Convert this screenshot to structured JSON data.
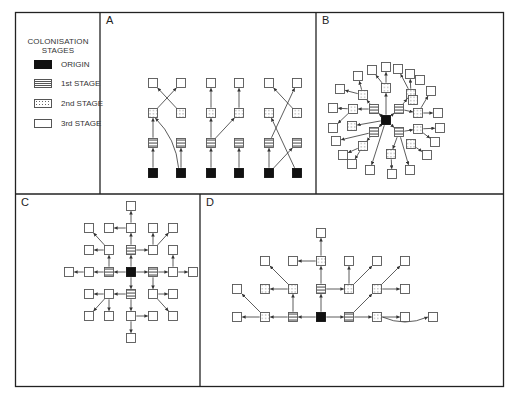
{
  "legend": {
    "title_line1": "COLONISATION",
    "title_line2": "STAGES",
    "items": [
      {
        "stage": "origin",
        "label": "ORIGIN"
      },
      {
        "stage": "first",
        "label": "1st STAGE"
      },
      {
        "stage": "second",
        "label": "2nd STAGE"
      },
      {
        "stage": "third",
        "label": "3rd STAGE"
      }
    ]
  },
  "colors": {
    "frame": "#222222",
    "node_border": "#555555",
    "origin_fill": "#111111",
    "arrow": "#333333"
  },
  "panels": {
    "A": {
      "label": "A",
      "description": "Six parallel chains of colonisation, with cross-linking between columns",
      "nodes": [
        {
          "id": "a1o",
          "stage": "origin",
          "x": 153,
          "y": 173
        },
        {
          "id": "a1f",
          "stage": "first",
          "x": 153,
          "y": 143
        },
        {
          "id": "a1s",
          "stage": "second",
          "x": 153,
          "y": 113
        },
        {
          "id": "a1t",
          "stage": "third",
          "x": 153,
          "y": 83
        },
        {
          "id": "a2o",
          "stage": "origin",
          "x": 181,
          "y": 173
        },
        {
          "id": "a2f",
          "stage": "first",
          "x": 181,
          "y": 143
        },
        {
          "id": "a2s",
          "stage": "second",
          "x": 181,
          "y": 113
        },
        {
          "id": "a2t",
          "stage": "third",
          "x": 181,
          "y": 83
        },
        {
          "id": "a3o",
          "stage": "origin",
          "x": 211,
          "y": 173
        },
        {
          "id": "a3f",
          "stage": "first",
          "x": 211,
          "y": 143
        },
        {
          "id": "a3s",
          "stage": "second",
          "x": 211,
          "y": 113
        },
        {
          "id": "a3t",
          "stage": "third",
          "x": 211,
          "y": 83
        },
        {
          "id": "a4o",
          "stage": "origin",
          "x": 239,
          "y": 173
        },
        {
          "id": "a4f",
          "stage": "first",
          "x": 239,
          "y": 143
        },
        {
          "id": "a4s",
          "stage": "second",
          "x": 239,
          "y": 113
        },
        {
          "id": "a4t",
          "stage": "third",
          "x": 239,
          "y": 83
        },
        {
          "id": "a5o",
          "stage": "origin",
          "x": 269,
          "y": 173
        },
        {
          "id": "a5f",
          "stage": "first",
          "x": 269,
          "y": 143
        },
        {
          "id": "a5s",
          "stage": "second",
          "x": 269,
          "y": 113
        },
        {
          "id": "a5t",
          "stage": "third",
          "x": 269,
          "y": 83
        },
        {
          "id": "a6o",
          "stage": "origin",
          "x": 297,
          "y": 173
        },
        {
          "id": "a6f",
          "stage": "first",
          "x": 297,
          "y": 143
        },
        {
          "id": "a6s",
          "stage": "second",
          "x": 297,
          "y": 113
        },
        {
          "id": "a6t",
          "stage": "third",
          "x": 297,
          "y": 83
        }
      ],
      "edges": [
        [
          "a1o",
          "a1f"
        ],
        [
          "a1f",
          "a1s"
        ],
        [
          "a1s",
          "a2t"
        ],
        [
          "a2o",
          "a2f"
        ],
        [
          "a2o",
          "a1s",
          "curve"
        ],
        [
          "a2s",
          "a1t"
        ],
        [
          "a3o",
          "a3f"
        ],
        [
          "a3f",
          "a3s"
        ],
        [
          "a3f",
          "a4s"
        ],
        [
          "a3s",
          "a3t"
        ],
        [
          "a4o",
          "a4f"
        ],
        [
          "a4s",
          "a4t"
        ],
        [
          "a5o",
          "a5f"
        ],
        [
          "a5o",
          "a6f"
        ],
        [
          "a5f",
          "a6t"
        ],
        [
          "a6o",
          "a5s"
        ],
        [
          "a6s",
          "a5t"
        ]
      ]
    },
    "B": {
      "label": "B",
      "description": "Radial colonisation outward from a central origin",
      "nodes": [
        {
          "id": "bo",
          "stage": "origin",
          "x": 386,
          "y": 120
        },
        {
          "id": "bf1",
          "stage": "first",
          "x": 374,
          "y": 109
        },
        {
          "id": "bf2",
          "stage": "first",
          "x": 399,
          "y": 109
        },
        {
          "id": "bf3",
          "stage": "first",
          "x": 374,
          "y": 132
        },
        {
          "id": "bf4",
          "stage": "first",
          "x": 399,
          "y": 132
        },
        {
          "id": "bs1",
          "stage": "second",
          "x": 386,
          "y": 88
        },
        {
          "id": "bs2",
          "stage": "second",
          "x": 363,
          "y": 95
        },
        {
          "id": "bs3",
          "stage": "second",
          "x": 353,
          "y": 109
        },
        {
          "id": "bs4",
          "stage": "second",
          "x": 352,
          "y": 126
        },
        {
          "id": "bs5",
          "stage": "second",
          "x": 363,
          "y": 146
        },
        {
          "id": "bs6",
          "stage": "second",
          "x": 391,
          "y": 154
        },
        {
          "id": "bs7",
          "stage": "second",
          "x": 411,
          "y": 94
        },
        {
          "id": "bs8",
          "stage": "second",
          "x": 413,
          "y": 100
        },
        {
          "id": "bs9",
          "stage": "second",
          "x": 418,
          "y": 113
        },
        {
          "id": "bs10",
          "stage": "second",
          "x": 418,
          "y": 129
        },
        {
          "id": "bs11",
          "stage": "second",
          "x": 411,
          "y": 144
        },
        {
          "id": "bt1",
          "stage": "third",
          "x": 372,
          "y": 70
        },
        {
          "id": "bt2",
          "stage": "third",
          "x": 386,
          "y": 67
        },
        {
          "id": "bt3",
          "stage": "third",
          "x": 398,
          "y": 69
        },
        {
          "id": "bt4",
          "stage": "third",
          "x": 410,
          "y": 74
        },
        {
          "id": "bt5",
          "stage": "third",
          "x": 420,
          "y": 80
        },
        {
          "id": "bt6",
          "stage": "third",
          "x": 358,
          "y": 76
        },
        {
          "id": "bt7",
          "stage": "third",
          "x": 340,
          "y": 89
        },
        {
          "id": "bt8",
          "stage": "third",
          "x": 333,
          "y": 108
        },
        {
          "id": "bt9",
          "stage": "third",
          "x": 333,
          "y": 128
        },
        {
          "id": "bt10",
          "stage": "third",
          "x": 336,
          "y": 141
        },
        {
          "id": "bt11",
          "stage": "third",
          "x": 343,
          "y": 155
        },
        {
          "id": "bt12",
          "stage": "third",
          "x": 352,
          "y": 164
        },
        {
          "id": "bt13",
          "stage": "third",
          "x": 370,
          "y": 170
        },
        {
          "id": "bt14",
          "stage": "third",
          "x": 392,
          "y": 174
        },
        {
          "id": "bt15",
          "stage": "third",
          "x": 410,
          "y": 170
        },
        {
          "id": "bt16",
          "stage": "third",
          "x": 427,
          "y": 155
        },
        {
          "id": "bt17",
          "stage": "third",
          "x": 435,
          "y": 142
        },
        {
          "id": "bt18",
          "stage": "third",
          "x": 440,
          "y": 128
        },
        {
          "id": "bt19",
          "stage": "third",
          "x": 438,
          "y": 113
        },
        {
          "id": "bt20",
          "stage": "third",
          "x": 431,
          "y": 91
        }
      ],
      "edges": [
        [
          "bo",
          "bf1"
        ],
        [
          "bo",
          "bf2"
        ],
        [
          "bo",
          "bf3"
        ],
        [
          "bo",
          "bf4"
        ],
        [
          "bo",
          "bs1"
        ],
        [
          "bo",
          "bs4"
        ],
        [
          "bo",
          "bt13"
        ],
        [
          "bf1",
          "bs2"
        ],
        [
          "bf1",
          "bs3"
        ],
        [
          "bf2",
          "bs7"
        ],
        [
          "bf2",
          "bs9"
        ],
        [
          "bf3",
          "bs5"
        ],
        [
          "bf3",
          "bt10"
        ],
        [
          "bf4",
          "bs6"
        ],
        [
          "bf4",
          "bt15"
        ],
        [
          "bf4",
          "bs10"
        ],
        [
          "bs1",
          "bt1"
        ],
        [
          "bs1",
          "bt2"
        ],
        [
          "bs2",
          "bt6"
        ],
        [
          "bs2",
          "bt7"
        ],
        [
          "bs3",
          "bt8"
        ],
        [
          "bs3",
          "bt9"
        ],
        [
          "bs5",
          "bt11"
        ],
        [
          "bs5",
          "bt12"
        ],
        [
          "bs6",
          "bt14"
        ],
        [
          "bs7",
          "bt4"
        ],
        [
          "bs7",
          "bt3"
        ],
        [
          "bs9",
          "bt19"
        ],
        [
          "bs9",
          "bt20"
        ],
        [
          "bs10",
          "bt18"
        ],
        [
          "bs10",
          "bt17"
        ],
        [
          "bs11",
          "bt16"
        ]
      ]
    },
    "C": {
      "label": "C",
      "description": "Grid-based diffusion from the origin in four directions",
      "nodes": [
        {
          "id": "co",
          "stage": "origin",
          "x": 131,
          "y": 272
        },
        {
          "id": "cfN",
          "stage": "first",
          "x": 131,
          "y": 250
        },
        {
          "id": "cfS",
          "stage": "first",
          "x": 131,
          "y": 294
        },
        {
          "id": "cfW",
          "stage": "first",
          "x": 109,
          "y": 272
        },
        {
          "id": "cfE",
          "stage": "first",
          "x": 153,
          "y": 272
        },
        {
          "id": "c1",
          "stage": "third",
          "x": 131,
          "y": 206
        },
        {
          "id": "c2",
          "stage": "third",
          "x": 89,
          "y": 228
        },
        {
          "id": "c3",
          "stage": "third",
          "x": 109,
          "y": 228
        },
        {
          "id": "c4",
          "stage": "third",
          "x": 131,
          "y": 228
        },
        {
          "id": "c5",
          "stage": "third",
          "x": 153,
          "y": 228
        },
        {
          "id": "c6",
          "stage": "third",
          "x": 173,
          "y": 228
        },
        {
          "id": "c7",
          "stage": "third",
          "x": 89,
          "y": 250
        },
        {
          "id": "c8",
          "stage": "third",
          "x": 109,
          "y": 250
        },
        {
          "id": "c9",
          "stage": "third",
          "x": 153,
          "y": 250
        },
        {
          "id": "c10",
          "stage": "third",
          "x": 173,
          "y": 250
        },
        {
          "id": "c11",
          "stage": "third",
          "x": 69,
          "y": 272
        },
        {
          "id": "c12",
          "stage": "third",
          "x": 89,
          "y": 272
        },
        {
          "id": "c13",
          "stage": "third",
          "x": 173,
          "y": 272
        },
        {
          "id": "c14",
          "stage": "third",
          "x": 193,
          "y": 272
        },
        {
          "id": "c15",
          "stage": "third",
          "x": 89,
          "y": 294
        },
        {
          "id": "c16",
          "stage": "third",
          "x": 109,
          "y": 294
        },
        {
          "id": "c17",
          "stage": "third",
          "x": 153,
          "y": 294
        },
        {
          "id": "c18",
          "stage": "third",
          "x": 173,
          "y": 294
        },
        {
          "id": "c19",
          "stage": "third",
          "x": 89,
          "y": 316
        },
        {
          "id": "c20",
          "stage": "third",
          "x": 109,
          "y": 316
        },
        {
          "id": "c21",
          "stage": "third",
          "x": 131,
          "y": 316
        },
        {
          "id": "c22",
          "stage": "third",
          "x": 153,
          "y": 316
        },
        {
          "id": "c23",
          "stage": "third",
          "x": 173,
          "y": 316
        },
        {
          "id": "c24",
          "stage": "third",
          "x": 131,
          "y": 338
        }
      ],
      "edges": [
        [
          "co",
          "cfN"
        ],
        [
          "co",
          "cfS"
        ],
        [
          "co",
          "cfW"
        ],
        [
          "co",
          "cfE"
        ],
        [
          "cfN",
          "c4"
        ],
        [
          "cfN",
          "c9"
        ],
        [
          "c4",
          "c1"
        ],
        [
          "c4",
          "c3"
        ],
        [
          "cfW",
          "c8"
        ],
        [
          "cfW",
          "c12"
        ],
        [
          "c8",
          "c7"
        ],
        [
          "c8",
          "c2"
        ],
        [
          "c12",
          "c11"
        ],
        [
          "cfE",
          "c13"
        ],
        [
          "cfE",
          "c17"
        ],
        [
          "c9",
          "c5"
        ],
        [
          "c9",
          "c6"
        ],
        [
          "c13",
          "c10"
        ],
        [
          "c13",
          "c14"
        ],
        [
          "c17",
          "c18"
        ],
        [
          "c17",
          "c23"
        ],
        [
          "cfS",
          "c16"
        ],
        [
          "cfS",
          "c21"
        ],
        [
          "c16",
          "c15"
        ],
        [
          "c16",
          "c19"
        ],
        [
          "c16",
          "c20"
        ],
        [
          "c21",
          "c22"
        ],
        [
          "c21",
          "c24"
        ]
      ]
    },
    "D": {
      "label": "D",
      "description": "Asymmetric spread from the origin, mostly upward and sideways",
      "nodes": [
        {
          "id": "do",
          "stage": "origin",
          "x": 321,
          "y": 317
        },
        {
          "id": "dfW",
          "stage": "first",
          "x": 293,
          "y": 317
        },
        {
          "id": "dfN",
          "stage": "first",
          "x": 321,
          "y": 289
        },
        {
          "id": "dfE",
          "stage": "first",
          "x": 349,
          "y": 317
        },
        {
          "id": "ds1",
          "stage": "second",
          "x": 265,
          "y": 317
        },
        {
          "id": "ds2",
          "stage": "second",
          "x": 293,
          "y": 289
        },
        {
          "id": "ds3",
          "stage": "second",
          "x": 265,
          "y": 289
        },
        {
          "id": "ds4",
          "stage": "second",
          "x": 321,
          "y": 261
        },
        {
          "id": "ds5",
          "stage": "second",
          "x": 349,
          "y": 289
        },
        {
          "id": "ds6",
          "stage": "second",
          "x": 377,
          "y": 289
        },
        {
          "id": "ds7",
          "stage": "second",
          "x": 377,
          "y": 317
        },
        {
          "id": "dt1",
          "stage": "third",
          "x": 237,
          "y": 317
        },
        {
          "id": "dt2",
          "stage": "third",
          "x": 237,
          "y": 289
        },
        {
          "id": "dt3",
          "stage": "third",
          "x": 265,
          "y": 261
        },
        {
          "id": "dt4",
          "stage": "third",
          "x": 293,
          "y": 261
        },
        {
          "id": "dt5",
          "stage": "third",
          "x": 321,
          "y": 233
        },
        {
          "id": "dt6",
          "stage": "third",
          "x": 349,
          "y": 261
        },
        {
          "id": "dt7",
          "stage": "third",
          "x": 377,
          "y": 261
        },
        {
          "id": "dt8",
          "stage": "third",
          "x": 405,
          "y": 261
        },
        {
          "id": "dt9",
          "stage": "third",
          "x": 405,
          "y": 289
        },
        {
          "id": "dt10",
          "stage": "third",
          "x": 405,
          "y": 317
        },
        {
          "id": "dt11",
          "stage": "third",
          "x": 433,
          "y": 317
        }
      ],
      "edges": [
        [
          "do",
          "dfW"
        ],
        [
          "do",
          "dfN"
        ],
        [
          "do",
          "dfE"
        ],
        [
          "dfW",
          "ds1"
        ],
        [
          "dfW",
          "ds2"
        ],
        [
          "ds1",
          "dt1"
        ],
        [
          "ds1",
          "dt2"
        ],
        [
          "ds2",
          "ds3"
        ],
        [
          "ds2",
          "dt3"
        ],
        [
          "dfN",
          "ds4"
        ],
        [
          "dfN",
          "ds5"
        ],
        [
          "ds4",
          "dt5"
        ],
        [
          "ds4",
          "dt4"
        ],
        [
          "dfE",
          "ds6"
        ],
        [
          "dfE",
          "ds7"
        ],
        [
          "ds5",
          "dt6"
        ],
        [
          "ds5",
          "dt7"
        ],
        [
          "ds6",
          "dt8"
        ],
        [
          "ds6",
          "dt9"
        ],
        [
          "ds7",
          "dt10"
        ],
        [
          "ds7",
          "dt11",
          "curve"
        ]
      ]
    }
  }
}
